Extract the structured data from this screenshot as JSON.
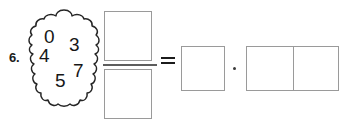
{
  "problem": {
    "number_label": "6.",
    "digit_cloud": {
      "shape": "scalloped-cloud-outline",
      "digits": [
        {
          "value": "0",
          "name": "digit-zero"
        },
        {
          "value": "3",
          "name": "digit-three"
        },
        {
          "value": "4",
          "name": "digit-four"
        },
        {
          "value": "7",
          "name": "digit-seven"
        },
        {
          "value": "5",
          "name": "digit-five"
        }
      ]
    },
    "fraction": {
      "numerator_value": "",
      "denominator_value": "",
      "bar": "fraction-bar"
    },
    "operators": {
      "equals": "=",
      "multiply": "·"
    },
    "result": {
      "single_box_value": "",
      "pair_box_values": [
        "",
        ""
      ]
    }
  },
  "colors": {
    "ink": "#1b1b1b",
    "digit_ink": "#171717",
    "box_border": "#9a9a9a",
    "fraction_bar": "#5d5d5d",
    "paper": "#ffffff"
  }
}
